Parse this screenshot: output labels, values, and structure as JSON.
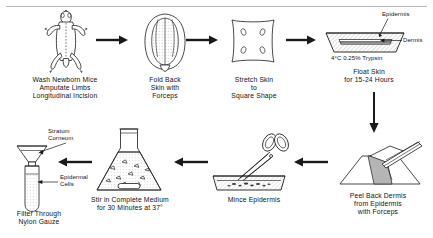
{
  "diagram": {
    "type": "process-flow",
    "orientation": "serpentine",
    "step_count": 8,
    "accent_color": "#1a1a1a",
    "background_color": "#ffffff",
    "rule_color": "#b9b9b9"
  },
  "steps": [
    {
      "index": 1,
      "id": "wash-mice",
      "caption": "Wash Newborn Mice\nAmputate Limbs\nLongitudinal Incision",
      "illustration": "mouse-supine-icon",
      "row": "top"
    },
    {
      "index": 2,
      "id": "fold-back-skin",
      "caption": "Fold Back\nSkin with\nForceps",
      "illustration": "folded-skin-icon",
      "row": "top"
    },
    {
      "index": 3,
      "id": "stretch-skin",
      "caption": "Stretch Skin\nto\nSquare Shape",
      "illustration": "square-skin-icon",
      "row": "top"
    },
    {
      "index": 4,
      "id": "float-skin",
      "caption": "Float Skin\nfor 15-24 Hours",
      "illustration": "trypsin-dish-icon",
      "row": "top",
      "annotations": [
        {
          "id": "epidermis-label",
          "text": "Epidermis"
        },
        {
          "id": "dermis-label",
          "text": "Dermis"
        },
        {
          "id": "trypsin-label",
          "text": "4°C 0.25% Trypsin"
        }
      ]
    },
    {
      "index": 5,
      "id": "peel-dermis",
      "caption": "Peel Back Dermis\nfrom Epidermis\nwith Forceps",
      "illustration": "forceps-peel-icon",
      "row": "bottom"
    },
    {
      "index": 6,
      "id": "mince-epidermis",
      "caption": "Mince Epidermis",
      "illustration": "scissors-tray-icon",
      "row": "bottom"
    },
    {
      "index": 7,
      "id": "stir-medium",
      "caption": "Stir in Complete Medium\nfor 30 Minutes at 37°",
      "illustration": "erlenmeyer-flask-icon",
      "row": "bottom"
    },
    {
      "index": 8,
      "id": "filter-gauze",
      "caption": "Filter Through\nNylon Gauze",
      "illustration": "funnel-tube-icon",
      "row": "bottom",
      "annotations": [
        {
          "id": "stratum-corneum-label",
          "text": "Stratum\nCorneum"
        },
        {
          "id": "epidermal-cells-label",
          "text": "Epidermal\nCells"
        }
      ]
    }
  ],
  "connectors": [
    {
      "id": "arrow-1-2",
      "direction": "right"
    },
    {
      "id": "arrow-2-3",
      "direction": "right"
    },
    {
      "id": "arrow-3-4",
      "direction": "right"
    },
    {
      "id": "arrow-4-5",
      "direction": "down"
    },
    {
      "id": "arrow-5-6",
      "direction": "left"
    },
    {
      "id": "arrow-6-7",
      "direction": "left"
    },
    {
      "id": "arrow-7-8",
      "direction": "left"
    }
  ]
}
